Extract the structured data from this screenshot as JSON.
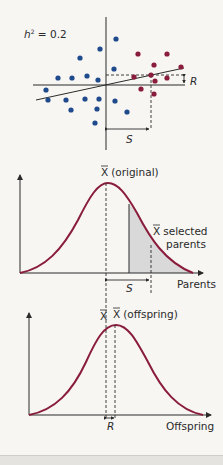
{
  "scatter_panel": {
    "heritability_label": "h² = 0.2",
    "h_symbol": "h",
    "h_exponent": "2",
    "h_value": " = 0.2",
    "response_label": "R",
    "selection_label": "S",
    "colors": {
      "unselected": "#1f4a8c",
      "selected": "#8a1c3c",
      "axis": "#2a2a2a"
    },
    "blue_dots": [
      [
        116,
        39
      ],
      [
        100,
        49
      ],
      [
        80,
        58
      ],
      [
        58,
        78
      ],
      [
        72,
        78
      ],
      [
        87,
        76
      ],
      [
        98,
        80
      ],
      [
        114,
        69
      ],
      [
        46,
        90
      ],
      [
        48,
        100
      ],
      [
        66,
        100
      ],
      [
        85,
        99
      ],
      [
        99,
        99
      ],
      [
        71,
        110
      ],
      [
        97,
        109
      ],
      [
        95,
        123
      ],
      [
        115,
        101
      ],
      [
        127,
        112
      ]
    ],
    "red_dots": [
      [
        138,
        54
      ],
      [
        167,
        54
      ],
      [
        154,
        65
      ],
      [
        181,
        67
      ],
      [
        134,
        77
      ],
      [
        151,
        75
      ],
      [
        155,
        81
      ],
      [
        167,
        78
      ],
      [
        141,
        89
      ],
      [
        154,
        94
      ]
    ]
  },
  "parents_panel": {
    "mean_original_label": "(original)",
    "x_bar": "X",
    "selected_label_1": "selected",
    "selected_label_2": "parents",
    "selection_label": "S",
    "axis_label": "Parents",
    "curve_color": "#8a1c3c",
    "shade_color": "#d6d6d6"
  },
  "offspring_panel": {
    "x_bar": "X",
    "mean_offspring_label": "(offspring)",
    "response_label": "R",
    "axis_label": "Offspring",
    "curve_color": "#8a1c3c"
  }
}
